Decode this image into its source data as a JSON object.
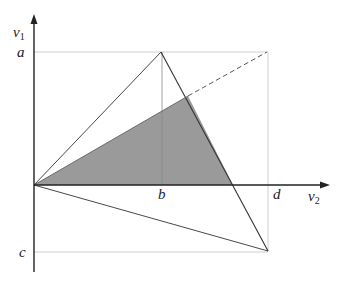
{
  "diagram": {
    "axes": {
      "vertical_label": "v",
      "vertical_subscript": "1",
      "horizontal_label": "v",
      "horizontal_subscript": "2"
    },
    "tick_labels": {
      "a": "a",
      "b": "b",
      "c": "c",
      "d": "d"
    },
    "points": {
      "origin": [
        34,
        185
      ],
      "apex_top": [
        161,
        52
      ],
      "bottom_right": [
        268,
        251
      ],
      "dashed_end": [
        267,
        52
      ],
      "shade_top": [
        188,
        96
      ],
      "shade_axis": [
        233,
        185
      ]
    },
    "colors": {
      "axis": "#222222",
      "edge": "#333333",
      "guide": "#cccccc",
      "shade": "#9a9a9a",
      "dashed": "#555555"
    }
  }
}
